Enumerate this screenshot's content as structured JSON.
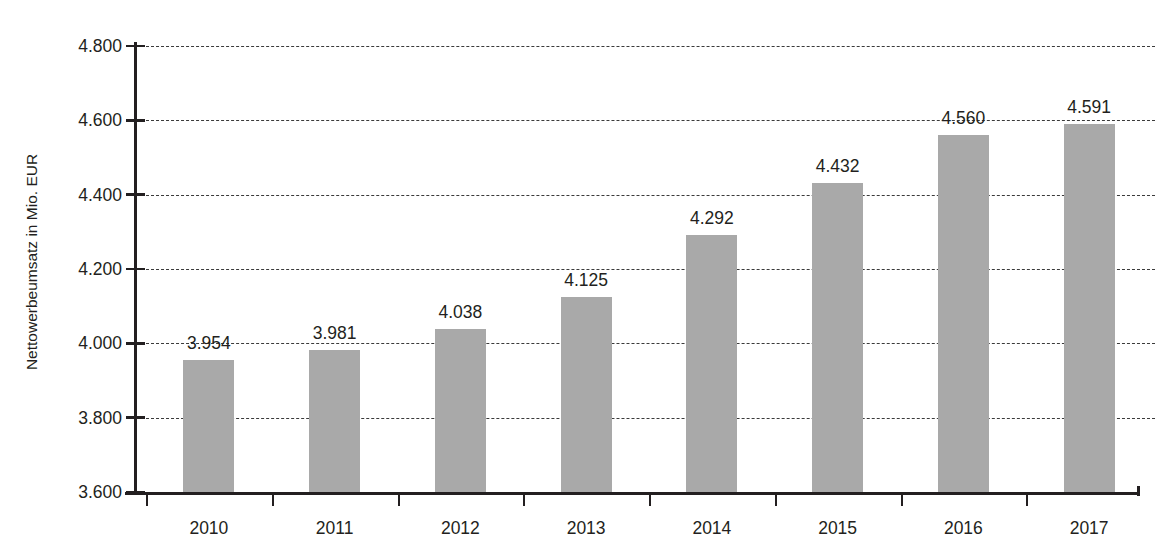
{
  "chart_data": {
    "type": "bar",
    "title": "",
    "xlabel": "",
    "ylabel": "Nettowerbeumsatz in Mio. EUR",
    "categories": [
      "2010",
      "2011",
      "2012",
      "2013",
      "2014",
      "2015",
      "2016",
      "2017"
    ],
    "values": [
      3954,
      3981,
      4038,
      4125,
      4292,
      4432,
      4560,
      4591
    ],
    "value_labels": [
      "3.954",
      "3.981",
      "4.038",
      "4.125",
      "4.292",
      "4.432",
      "4.560",
      "4.591"
    ],
    "ylim": [
      3600,
      4800
    ],
    "yticks": [
      3600,
      3800,
      4000,
      4200,
      4400,
      4600,
      4800
    ],
    "ytick_labels": [
      "3.600",
      "3.800",
      "4.000",
      "4.200",
      "4.400",
      "4.600",
      "4.800"
    ],
    "grid": true,
    "grid_style": "dashed",
    "legend": "none",
    "series": [
      {
        "name": "Nettowerbeumsatz",
        "values": [
          3954,
          3981,
          4038,
          4125,
          4292,
          4432,
          4560,
          4591
        ]
      }
    ],
    "colors": {
      "bar": "#a9a9a9",
      "axis": "#231f20",
      "grid": "#3b3b3b",
      "text": "#231f20",
      "title": "#9e3a34"
    }
  },
  "figure": {
    "title_cropped": "",
    "axis_label_y": "Nettowerbeumsatz in Mio. EUR"
  }
}
